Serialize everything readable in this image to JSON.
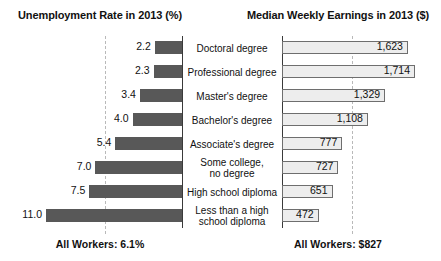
{
  "headers": {
    "left": "Unemployment Rate in 2013 (%)",
    "right": "Median Weekly Earnings in 2013 ($)"
  },
  "footers": {
    "left": "All Workers: 6.1%",
    "right": "All Workers: $827"
  },
  "chart_data": {
    "type": "bar",
    "orientation": "horizontal",
    "layout": "back-to-back butterfly / tornado, shared category axis in center",
    "grid": "dashed vertical gridline on each panel",
    "legend": null,
    "categories": [
      "Doctoral degree",
      "Professional degree",
      "Master's degree",
      "Bachelor's degree",
      "Associate's degree",
      "Some college,\nno degree",
      "High school diploma",
      "Less than a high\nschool diploma"
    ],
    "series": [
      {
        "name": "Unemployment Rate in 2013 (%)",
        "panel": "left",
        "direction": "right-to-left",
        "unit": "%",
        "color": "#585858",
        "values": [
          2.2,
          2.3,
          3.4,
          4.0,
          5.4,
          7.0,
          7.5,
          11.0
        ],
        "labels": [
          "2.2",
          "2.3",
          "3.4",
          "4.0",
          "5.4",
          "7.0",
          "7.5",
          "11.0"
        ],
        "axis_max": 12.0,
        "gridline_at": 6.1,
        "overall": "All Workers: 6.1%",
        "overall_value": 6.1
      },
      {
        "name": "Median Weekly Earnings in 2013 ($)",
        "panel": "right",
        "direction": "left-to-right",
        "unit": "$",
        "color": "#ededed",
        "border_color": "#6e6e6e",
        "values": [
          1623,
          1714,
          1329,
          1108,
          777,
          727,
          651,
          472
        ],
        "labels": [
          "1,623",
          "1,714",
          "1,329",
          "1,108",
          "777",
          "727",
          "651",
          "472"
        ],
        "axis_max": 1800,
        "gridline_at": 827,
        "overall": "All Workers: $827",
        "overall_value": 827
      }
    ]
  }
}
